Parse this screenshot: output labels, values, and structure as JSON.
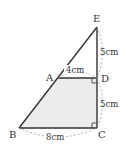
{
  "figure": {
    "points": {
      "E": {
        "label": "E",
        "x": 97,
        "y": 27
      },
      "A": {
        "label": "A",
        "x": 58,
        "y": 78
      },
      "D": {
        "label": "D",
        "x": 97,
        "y": 78
      },
      "B": {
        "label": "B",
        "x": 19,
        "y": 128
      },
      "C": {
        "label": "C",
        "x": 97,
        "y": 128
      }
    },
    "dimensions": {
      "ED": "5cm",
      "DC": "5cm",
      "AD": "4cm",
      "BC": "8cm"
    },
    "shaded_region": "ABCD",
    "colors": {
      "line": "#333333",
      "fill": "#ececec",
      "dash": "#999999"
    }
  }
}
